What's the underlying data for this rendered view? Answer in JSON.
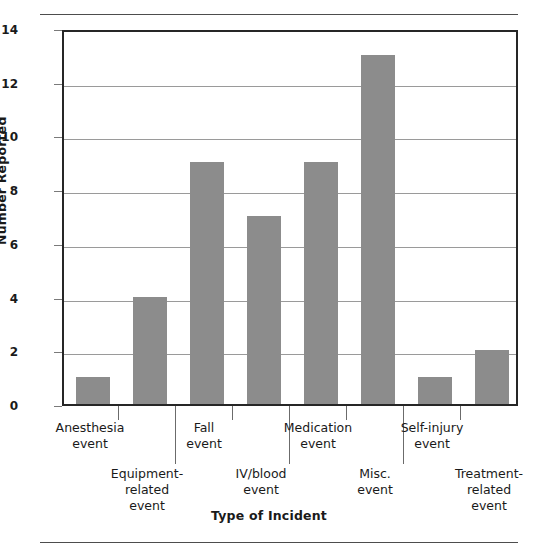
{
  "chart_data": {
    "type": "bar",
    "title": "",
    "xlabel": "Type of Incident",
    "ylabel": "Number Reported",
    "categories": [
      "Anesthesia event",
      "Equipment-related event",
      "Fall event",
      "IV/blood event",
      "Medication event",
      "Misc. event",
      "Self-injury event",
      "Treatment-related event"
    ],
    "category_lines": [
      [
        "Anesthesia",
        "event"
      ],
      [
        "Equipment-",
        "related",
        "event"
      ],
      [
        "Fall",
        "event"
      ],
      [
        "IV/blood",
        "event"
      ],
      [
        "Medication",
        "event"
      ],
      [
        "Misc.",
        "event"
      ],
      [
        "Self-injury",
        "event"
      ],
      [
        "Treatment-",
        "related",
        "event"
      ]
    ],
    "values": [
      1,
      4,
      9,
      7,
      9,
      13,
      1,
      2
    ],
    "ylim": [
      0,
      14
    ],
    "ytick_values": [
      0,
      2,
      4,
      6,
      8,
      10,
      12,
      14
    ],
    "ytick_labels": [
      "0",
      "2",
      "4",
      "6",
      "8",
      "10",
      "12",
      "14"
    ],
    "grid": true,
    "grid_orientation": "horizontal",
    "legend": "none",
    "bar_color": "#8c8c8c",
    "axis_color": "#262626",
    "grid_color": "#9a9a9a"
  },
  "axis": {
    "y_title": "Number Reported",
    "x_title": "Type of Incident"
  },
  "ylabels": {
    "t0": "0",
    "t2": "2",
    "t4": "4",
    "t6": "6",
    "t8": "8",
    "t10": "10",
    "t12": "12",
    "t14": "14"
  },
  "xlabels": {
    "c0_l1": "Anesthesia",
    "c0_l2": "event",
    "c1_l1": "Equipment-",
    "c1_l2": "related",
    "c1_l3": "event",
    "c2_l1": "Fall",
    "c2_l2": "event",
    "c3_l1": "IV/blood",
    "c3_l2": "event",
    "c4_l1": "Medication",
    "c4_l2": "event",
    "c5_l1": "Misc.",
    "c5_l2": "event",
    "c6_l1": "Self-injury",
    "c6_l2": "event",
    "c7_l1": "Treatment-",
    "c7_l2": "related",
    "c7_l3": "event"
  }
}
